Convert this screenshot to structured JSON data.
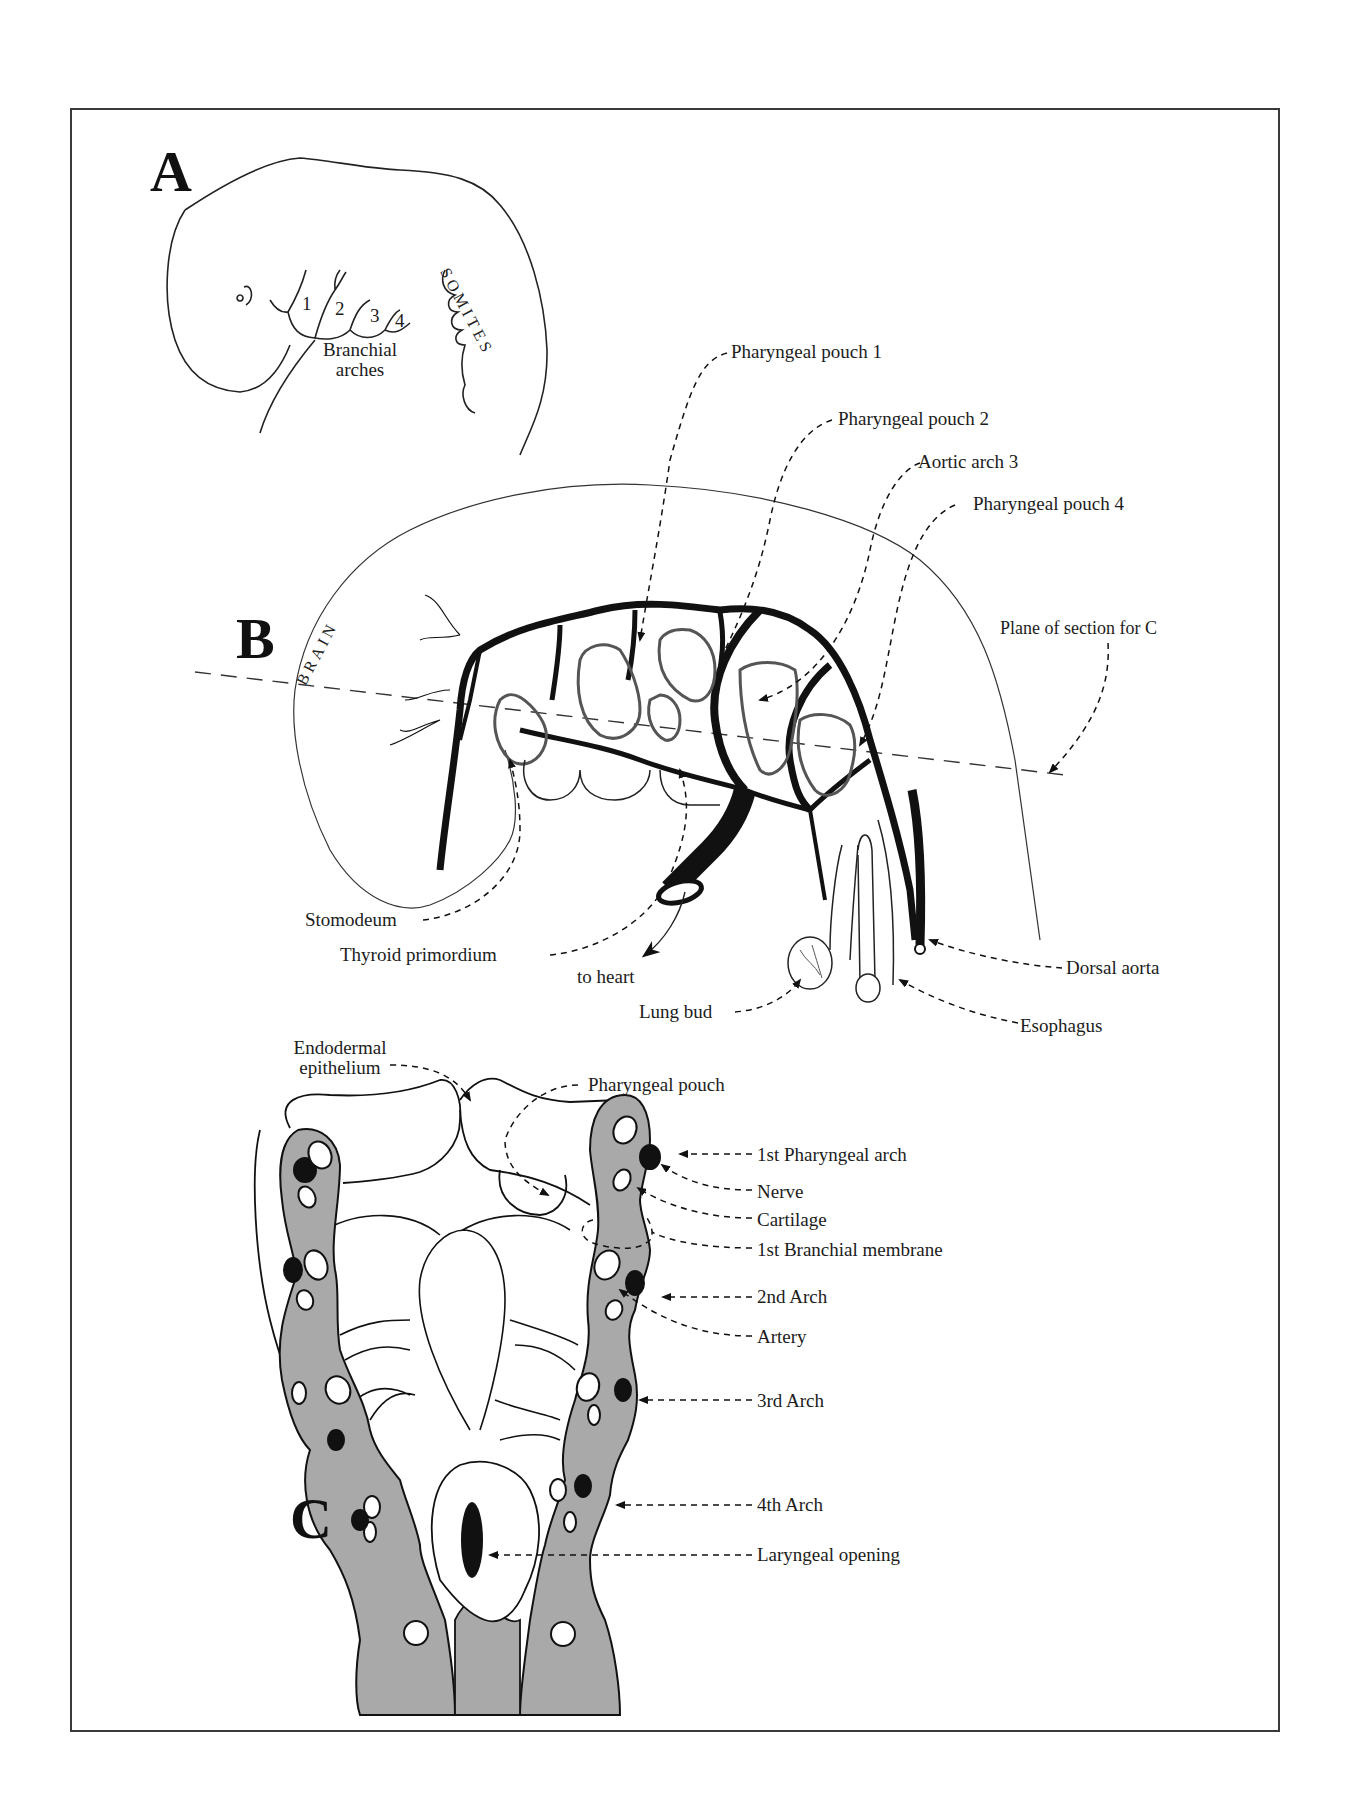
{
  "figure": {
    "panels": {
      "A": {
        "letter": "A",
        "numbers": [
          "1",
          "2",
          "3",
          "4"
        ],
        "branchial_label_line1": "Branchial",
        "branchial_label_line2": "arches",
        "somites_label": "SOMITES"
      },
      "B": {
        "letter": "B",
        "brain_label": "BRAIN",
        "labels": {
          "pouch1": "Pharyngeal pouch 1",
          "pouch2": "Pharyngeal pouch 2",
          "aortic3": "Aortic arch 3",
          "pouch4": "Pharyngeal pouch 4",
          "plane": "Plane of section for C",
          "stomodeum": "Stomodeum",
          "thyroid": "Thyroid primordium",
          "heart": "to heart",
          "lung": "Lung bud",
          "dorsal": "Dorsal aorta",
          "esophagus": "Esophagus"
        }
      },
      "C": {
        "letter": "C",
        "labels": {
          "endo_line1": "Endodermal",
          "endo_line2": "epithelium",
          "pouch": "Pharyngeal pouch",
          "arch1": "1st Pharyngeal arch",
          "nerve": "Nerve",
          "cartilage": "Cartilage",
          "membrane": "1st Branchial membrane",
          "arch2": "2nd Arch",
          "artery": "Artery",
          "arch3": "3rd Arch",
          "arch4": "4th Arch",
          "laryngeal": "Laryngeal opening"
        }
      }
    },
    "colors": {
      "tissue_gray": "#a9a9a9",
      "ink": "#111111",
      "frame": "#3a3a3a",
      "background": "#ffffff"
    }
  }
}
